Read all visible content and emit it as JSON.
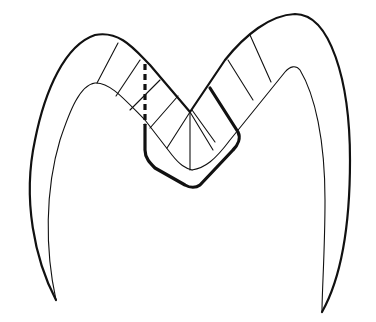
{
  "figure": {
    "type": "line-drawing",
    "colors": {
      "stroke": "#111111",
      "background": "#ffffff"
    },
    "elements": [
      "outer-enamel-outline",
      "inner-dentin-outline",
      "enamel-rod-lines",
      "cavity-preparation-outline",
      "dashed-cut-line"
    ]
  }
}
